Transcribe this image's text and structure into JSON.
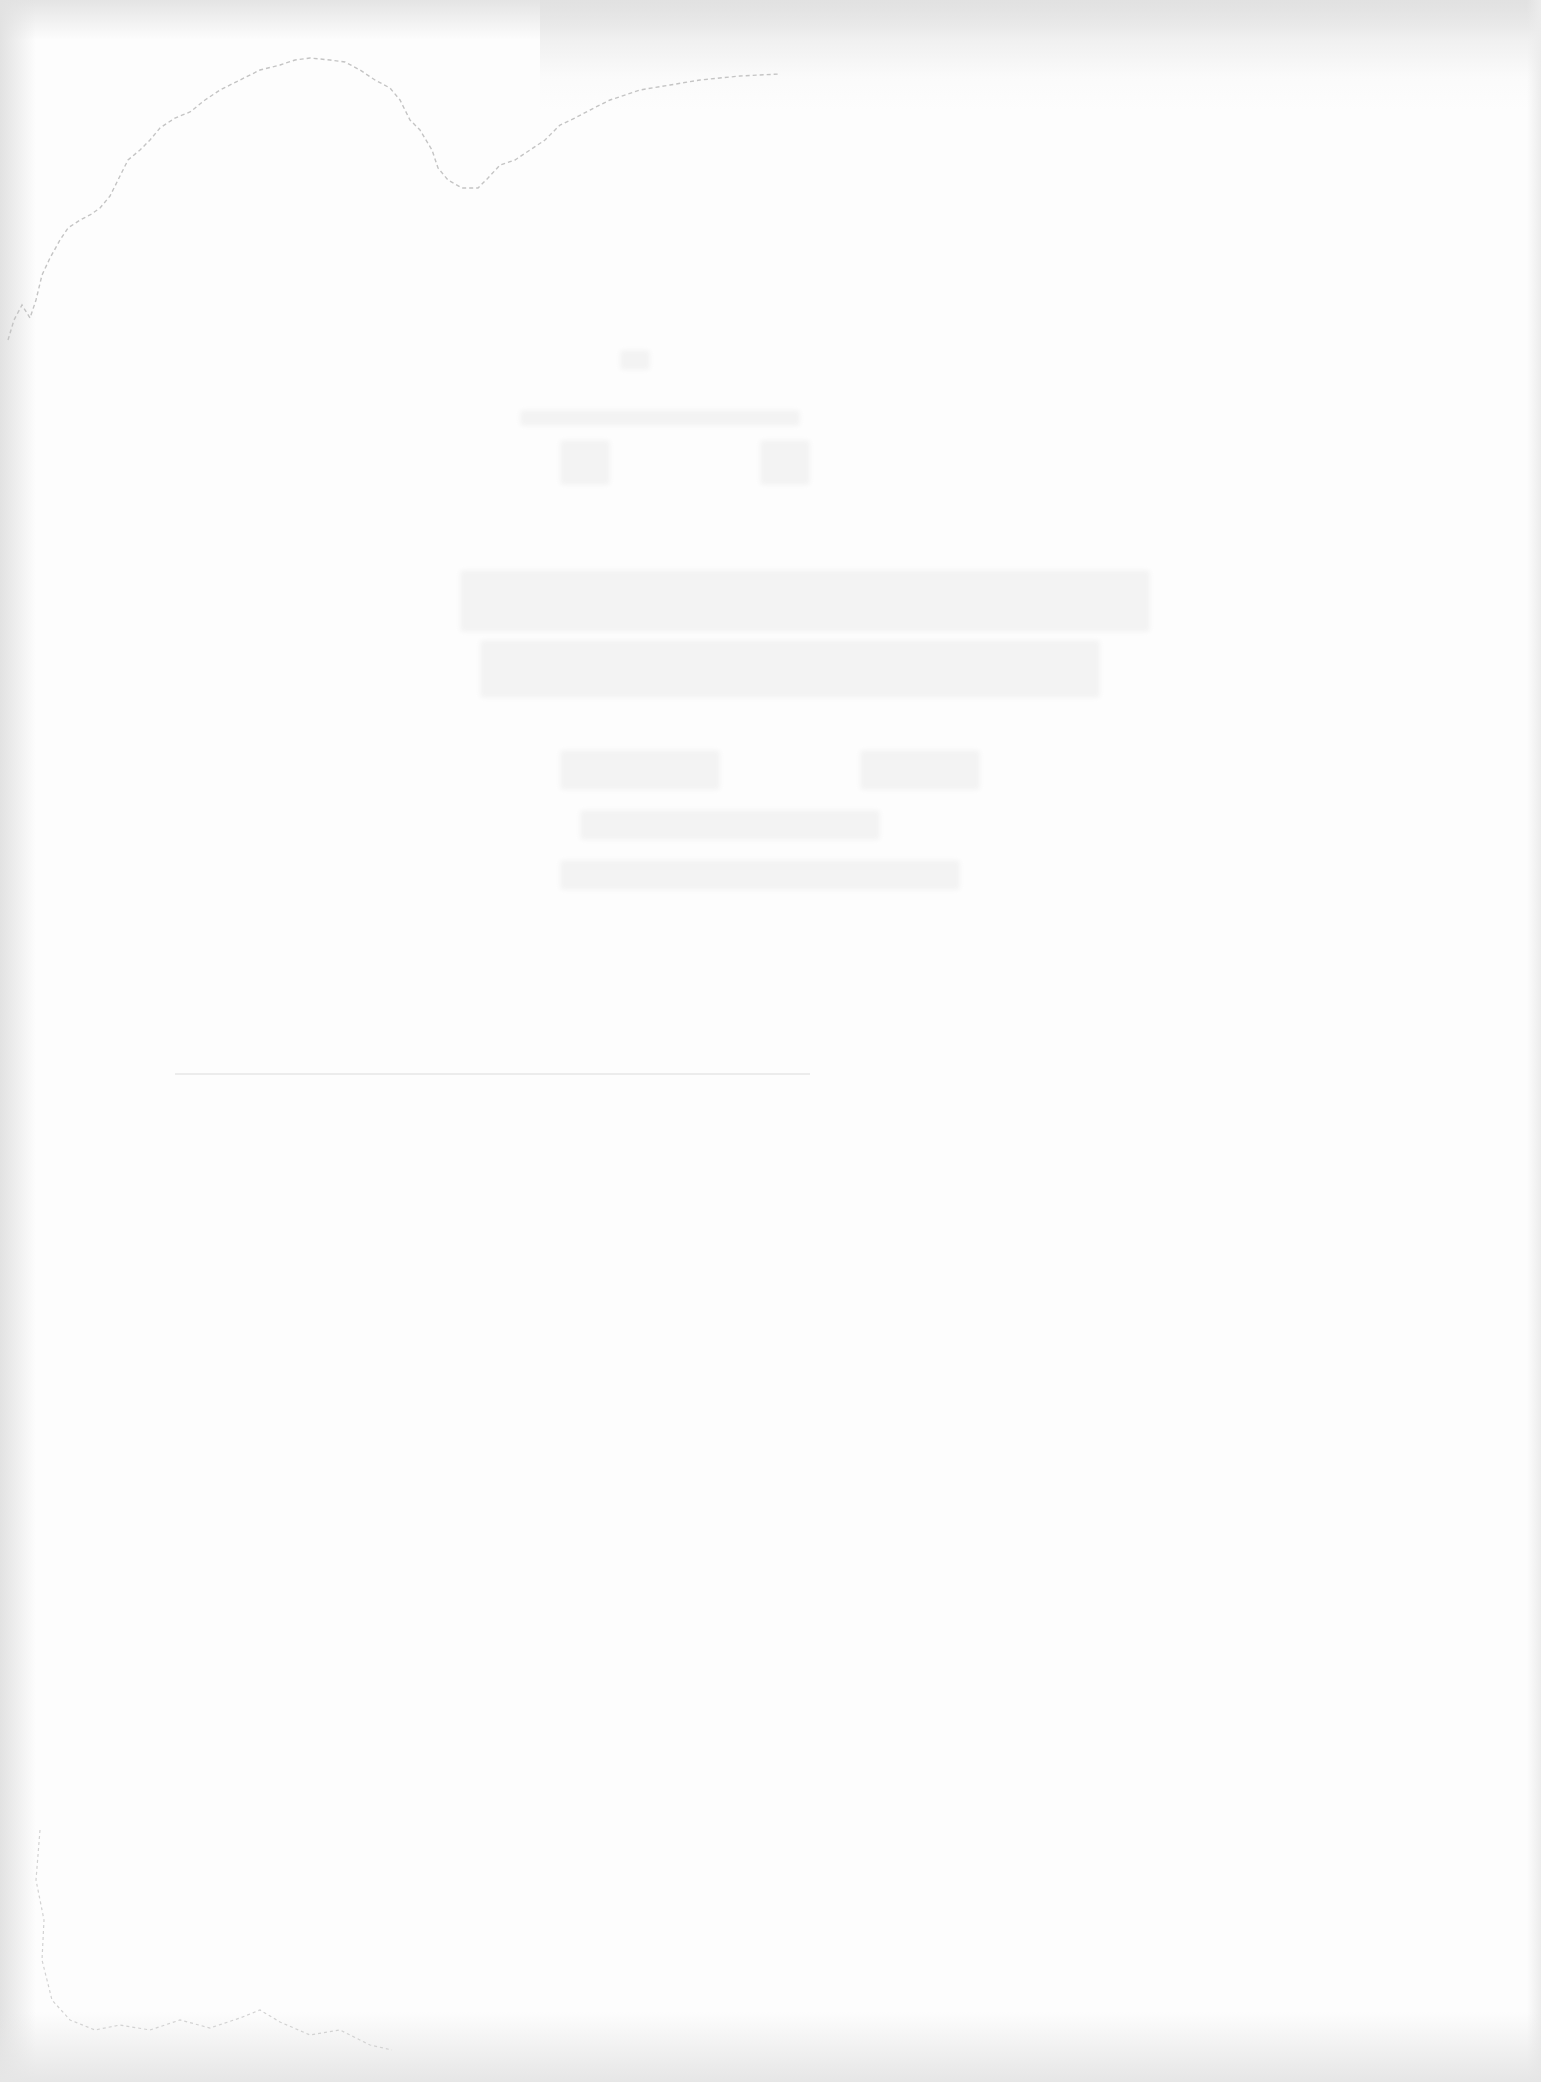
{
  "page": {
    "type": "blank-scanned-page",
    "background_color": "#fdfdfd",
    "edge_shadow_color": "#e2e2e2",
    "ghost_color": "#ececec",
    "visible_text": []
  }
}
